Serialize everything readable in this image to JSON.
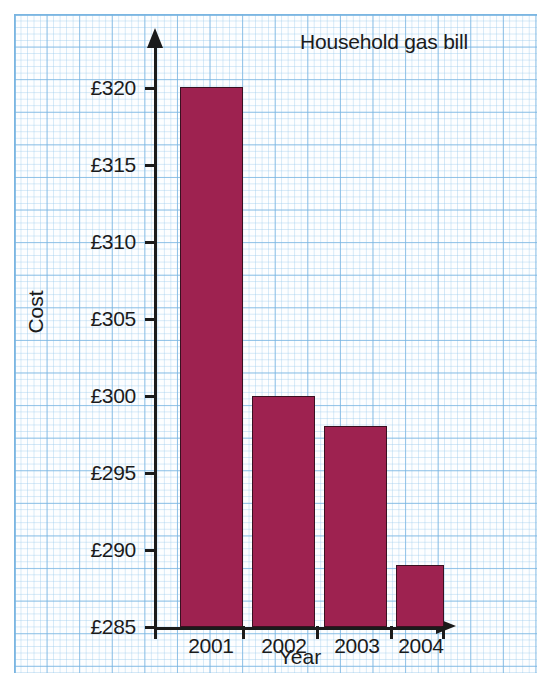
{
  "chart_data": {
    "type": "bar",
    "title": "Household gas bill",
    "xlabel": "Year",
    "ylabel": "Cost",
    "categories": [
      "2001",
      "2002",
      "2003",
      "2004"
    ],
    "values": [
      320,
      300,
      298,
      289
    ],
    "value_prefix": "£",
    "ylim": [
      285,
      320
    ],
    "ytick_step": 5,
    "ytick_labels": [
      "£320",
      "£315",
      "£310",
      "£305",
      "£300",
      "£295",
      "£290",
      "£285"
    ],
    "ytick_values": [
      320,
      315,
      310,
      305,
      300,
      295,
      290,
      285
    ],
    "grid": true,
    "grid_style": "graph-paper",
    "legend": "none",
    "bar_color": "#9e2250",
    "bar_outline_color": "#3a1020",
    "axis_color": "#1b1b1b",
    "grid_color": "#78b4e1",
    "background_color": "#fdfeff"
  }
}
